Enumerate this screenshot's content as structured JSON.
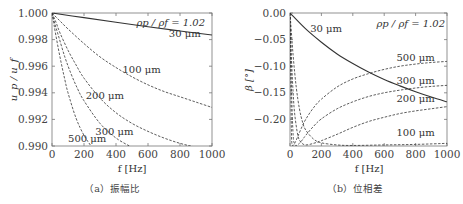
{
  "chart_data": [
    {
      "type": "line",
      "caption": "（a）振幅比",
      "xlabel": "f [Hz]",
      "ylabel": "u_p / u_f",
      "xlim": [
        0,
        1000
      ],
      "ylim": [
        0.99,
        1.0
      ],
      "xticks": [
        "0",
        "200",
        "400",
        "600",
        "800",
        "1000"
      ],
      "yticks": [
        "0.990",
        "0.992",
        "0.994",
        "0.996",
        "0.998",
        "1.000"
      ],
      "annotation": "ρp / ρf = 1.02",
      "series": [
        {
          "name": "30 μm",
          "style": "solid",
          "x": [
            0,
            200,
            400,
            600,
            800,
            1000
          ],
          "y": [
            1.0,
            0.99965,
            0.9993,
            0.99897,
            0.99865,
            0.99835
          ]
        },
        {
          "name": "100 μm",
          "style": "dashed",
          "x": [
            0,
            50,
            100,
            200,
            300,
            400,
            500,
            600,
            700,
            800,
            900,
            1000
          ],
          "y": [
            1.0,
            0.9994,
            0.9988,
            0.9977,
            0.9967,
            0.9959,
            0.9952,
            0.9946,
            0.9941,
            0.9937,
            0.9933,
            0.9929
          ]
        },
        {
          "name": "200 μm",
          "style": "dashed",
          "x": [
            0,
            25,
            50,
            100,
            150,
            200,
            300,
            400,
            500,
            600,
            700,
            800,
            900,
            1000
          ],
          "y": [
            1.0,
            0.9993,
            0.9985,
            0.9972,
            0.9961,
            0.9951,
            0.9936,
            0.9925,
            0.9917,
            0.9911,
            0.9906,
            0.9902,
            0.9899,
            0.9896
          ]
        },
        {
          "name": "300 μm",
          "style": "dashed",
          "x": [
            0,
            20,
            40,
            80,
            120,
            160,
            200,
            300,
            400,
            500
          ],
          "y": [
            1.0,
            0.9991,
            0.9983,
            0.9967,
            0.9954,
            0.9943,
            0.9934,
            0.9917,
            0.9906,
            0.9899
          ]
        },
        {
          "name": "500 μm",
          "style": "dashed",
          "x": [
            0,
            10,
            20,
            40,
            60,
            80,
            100,
            150,
            200,
            250
          ],
          "y": [
            1.0,
            0.9993,
            0.9986,
            0.9973,
            0.9961,
            0.995,
            0.994,
            0.9921,
            0.9908,
            0.9899
          ]
        }
      ],
      "labels": [
        {
          "text": "30 μm",
          "x": 830,
          "y": 0.9982
        },
        {
          "text": "100 μm",
          "x": 560,
          "y": 0.9955
        },
        {
          "text": "200 μm",
          "x": 330,
          "y": 0.9935
        },
        {
          "text": "300 μm",
          "x": 390,
          "y": 0.9908
        },
        {
          "text": "500 μm",
          "x": 220,
          "y": 0.9903
        }
      ]
    },
    {
      "type": "line",
      "caption": "（b）位相差",
      "xlabel": "f [Hz]",
      "ylabel": "β [°]",
      "xlim": [
        0,
        1000
      ],
      "ylim": [
        -0.25,
        0.0
      ],
      "xticks": [
        "0",
        "200",
        "400",
        "600",
        "800",
        "1000"
      ],
      "yticks": [
        "0.00",
        "−0.05",
        "−0.10",
        "−0.15",
        "−0.20"
      ],
      "annotation": "ρp / ρf = 1.02",
      "series": [
        {
          "name": "30 μm",
          "style": "solid",
          "x": [
            0,
            100,
            200,
            300,
            400,
            500,
            600,
            700,
            800,
            900,
            1000
          ],
          "y": [
            0,
            -0.03,
            -0.055,
            -0.077,
            -0.095,
            -0.111,
            -0.125,
            -0.137,
            -0.148,
            -0.158,
            -0.167
          ]
        },
        {
          "name": "100 μm",
          "style": "dashed",
          "x": [
            0,
            20,
            40,
            60,
            80,
            100,
            150,
            200,
            300,
            400,
            600,
            800,
            1000
          ],
          "y": [
            0,
            -0.08,
            -0.14,
            -0.18,
            -0.205,
            -0.22,
            -0.237,
            -0.244,
            -0.248,
            -0.249,
            -0.248,
            -0.247,
            -0.245
          ]
        },
        {
          "name": "200 μm",
          "style": "dashed",
          "x": [
            0,
            10,
            20,
            30,
            50,
            70,
            100,
            150,
            200,
            300,
            400,
            500,
            600,
            700,
            800,
            900,
            1000
          ],
          "y": [
            0,
            -0.09,
            -0.15,
            -0.19,
            -0.23,
            -0.243,
            -0.248,
            -0.245,
            -0.24,
            -0.228,
            -0.215,
            -0.204,
            -0.196,
            -0.189,
            -0.184,
            -0.18,
            -0.176
          ]
        },
        {
          "name": "300 μm",
          "style": "dashed",
          "x": [
            0,
            5,
            10,
            20,
            30,
            40,
            60,
            80,
            100,
            150,
            200,
            300,
            400,
            500,
            600,
            700,
            800,
            900,
            1000
          ],
          "y": [
            0,
            -0.08,
            -0.15,
            -0.23,
            -0.246,
            -0.249,
            -0.245,
            -0.238,
            -0.23,
            -0.213,
            -0.199,
            -0.18,
            -0.167,
            -0.157,
            -0.15,
            -0.145,
            -0.141,
            -0.138,
            -0.136
          ]
        },
        {
          "name": "500 μm",
          "style": "dashed",
          "x": [
            0,
            3,
            6,
            10,
            15,
            20,
            30,
            50,
            70,
            100,
            150,
            200,
            300,
            400,
            500,
            600,
            700,
            800,
            900,
            1000
          ],
          "y": [
            0,
            -0.08,
            -0.16,
            -0.235,
            -0.248,
            -0.249,
            -0.245,
            -0.232,
            -0.218,
            -0.2,
            -0.178,
            -0.162,
            -0.139,
            -0.124,
            -0.114,
            -0.106,
            -0.1,
            -0.096,
            -0.093,
            -0.091
          ]
        }
      ],
      "labels": [
        {
          "text": "30 μm",
          "x": 230,
          "y": -0.035
        },
        {
          "text": "500 μm",
          "x": 800,
          "y": -0.09
        },
        {
          "text": "300 μm",
          "x": 800,
          "y": -0.133
        },
        {
          "text": "200 μm",
          "x": 800,
          "y": -0.168
        },
        {
          "text": "100 μm",
          "x": 800,
          "y": -0.232
        }
      ]
    }
  ]
}
